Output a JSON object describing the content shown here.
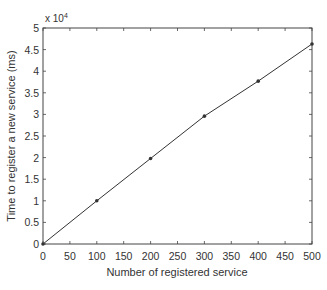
{
  "chart_data": {
    "type": "line",
    "title": "",
    "xlabel": "Number of registered service",
    "ylabel": "Time to register a new service (ms)",
    "y_multiplier_label": "x 10",
    "y_multiplier_exponent": "4",
    "xlim": [
      0,
      500
    ],
    "ylim": [
      0,
      5
    ],
    "y_scale": 10000,
    "x_ticks": [
      0,
      50,
      100,
      150,
      200,
      250,
      300,
      350,
      400,
      450,
      500
    ],
    "y_ticks": [
      0,
      0.5,
      1,
      1.5,
      2,
      2.5,
      3,
      3.5,
      4,
      4.5,
      5
    ],
    "y_tick_labels": [
      "0",
      "0.5",
      "1",
      "1.5",
      "2",
      "2.5",
      "3",
      "3.5",
      "4",
      "4.5",
      "5"
    ],
    "grid": false,
    "legend": null,
    "series": [
      {
        "name": "Registration time",
        "x": [
          0,
          100,
          200,
          300,
          400,
          500
        ],
        "values": [
          0,
          1.0,
          1.98,
          2.96,
          3.77,
          4.63
        ],
        "marker": "dot",
        "color": "#333333"
      }
    ]
  }
}
